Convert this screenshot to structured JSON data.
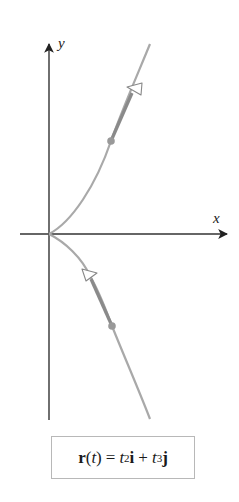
{
  "figure": {
    "axes": {
      "x_label": "x",
      "y_label": "y",
      "axis_color": "#333333"
    },
    "curve": {
      "name": "semicubical parabola",
      "color": "#a9a9a9",
      "highlight_color": "#8a8a8a",
      "point_color": "#999999",
      "upper_branch": {
        "direction": "away from origin (up-right)",
        "has_point": true,
        "has_tangent_arrow": true
      },
      "lower_branch": {
        "direction": "toward origin (up-left)",
        "has_point": true,
        "has_tangent_arrow": true
      }
    },
    "formula": {
      "r": "r",
      "open_paren": "(",
      "t": "t",
      "close_paren": ")",
      "equals": "=",
      "t1": "t",
      "exp1": "2",
      "i": "i",
      "plus": "+",
      "t2": "t",
      "exp2": "3",
      "j": "j"
    }
  }
}
